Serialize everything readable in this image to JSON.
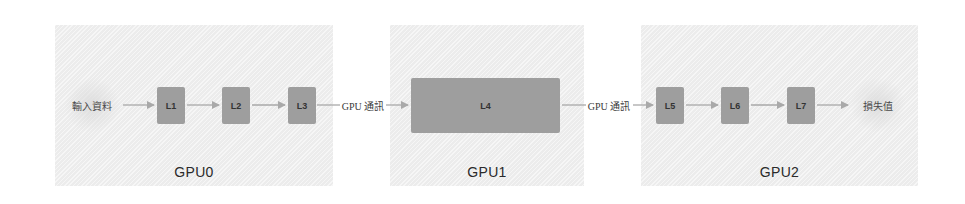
{
  "diagram": {
    "title": "",
    "colors": {
      "panel_bg": "#ececec",
      "layer_fill": "#9e9e9e",
      "arrow": "#a9a9a9",
      "text": "#2a2a2a"
    },
    "input_label": "輸入資料",
    "output_label": "損失值",
    "comm_label_1": "GPU 通訊",
    "comm_label_2": "GPU 通訊",
    "panels": [
      {
        "id": "gpu0",
        "label": "GPU0",
        "layers": [
          "L1",
          "L2",
          "L3"
        ]
      },
      {
        "id": "gpu1",
        "label": "GPU1",
        "layers": [
          "L4"
        ]
      },
      {
        "id": "gpu2",
        "label": "GPU2",
        "layers": [
          "L5",
          "L6",
          "L7"
        ]
      }
    ],
    "edges": [
      [
        "輸入資料",
        "L1"
      ],
      [
        "L1",
        "L2"
      ],
      [
        "L2",
        "L3"
      ],
      [
        "L3",
        "L4"
      ],
      [
        "L4",
        "L5"
      ],
      [
        "L5",
        "L6"
      ],
      [
        "L6",
        "L7"
      ],
      [
        "L7",
        "損失值"
      ]
    ]
  }
}
